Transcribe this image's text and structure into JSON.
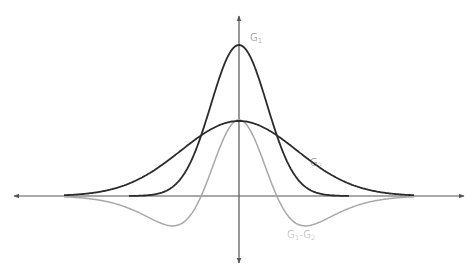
{
  "diagram": {
    "title": "",
    "axes": {
      "origin": {
        "x": 239,
        "y": 196
      },
      "x_axis": {
        "x1": 14,
        "x2": 464,
        "color": "#555555"
      },
      "y_axis": {
        "y1": 16,
        "y2": 263,
        "color": "#555555"
      }
    },
    "curves": [
      {
        "id": "G1",
        "label": "G",
        "subscript": "1",
        "amplitude": 151,
        "sigma": 28,
        "color": "#2b2b2b",
        "width": 1.8,
        "label_x": 250,
        "label_y": 41
      },
      {
        "id": "G2",
        "label": "G",
        "subscript": "2",
        "amplitude": 75,
        "sigma": 58,
        "color": "#2b2b2b",
        "width": 1.8,
        "label_x": 310,
        "label_y": 166
      },
      {
        "id": "G1-G2",
        "label": "G",
        "subscript": "1",
        "label2": "-G",
        "subscript2": "2",
        "color": "#a8a8a8",
        "width": 1.5,
        "label_x": 287,
        "label_y": 238
      }
    ]
  },
  "chart_data": {
    "type": "line",
    "title": "",
    "xlabel": "",
    "ylabel": "",
    "series": [
      {
        "name": "G1",
        "description": "narrow Gaussian, peak ≈ 2.0 (relative)",
        "peak": 151,
        "sigma": 28
      },
      {
        "name": "G2",
        "description": "wide Gaussian, peak ≈ 1.0 (relative)",
        "peak": 75,
        "sigma": 58
      },
      {
        "name": "G1-G2",
        "description": "difference of Gaussians (Mexican hat), center ≈ 1.0, side minima ≈ -0.35 at x ≈ ±60"
      }
    ],
    "legend": [
      "G1",
      "G2",
      "G1-G2"
    ],
    "grid": false
  }
}
